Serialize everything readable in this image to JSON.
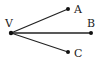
{
  "diagram": {
    "title": "",
    "points": [
      {
        "id": "V",
        "label": "V",
        "x": 11,
        "y": 33,
        "lx": 5,
        "ly": 27
      },
      {
        "id": "A",
        "label": "A",
        "x": 68,
        "y": 9,
        "lx": 74,
        "ly": 13
      },
      {
        "id": "B",
        "label": "B",
        "x": 91,
        "y": 33,
        "lx": 87,
        "ly": 27
      },
      {
        "id": "C",
        "label": "C",
        "x": 68,
        "y": 52,
        "lx": 74,
        "ly": 57
      }
    ],
    "rays": [
      {
        "from": "V",
        "to": "A"
      },
      {
        "from": "V",
        "to": "B"
      },
      {
        "from": "V",
        "to": "C"
      }
    ],
    "colors": {
      "stroke": "#222222",
      "point": "#111111"
    }
  }
}
